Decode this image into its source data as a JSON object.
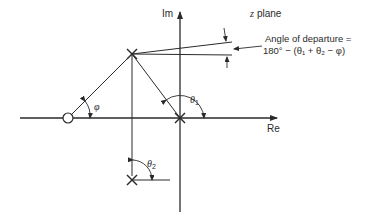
{
  "diagram": {
    "axes": {
      "imaginary_label": "Im",
      "real_label": "Re"
    },
    "poles": [
      {
        "name": "pole-upper",
        "x": 132,
        "y": 54
      },
      {
        "name": "pole-origin",
        "x": 180,
        "y": 118
      },
      {
        "name": "pole-lower",
        "x": 132,
        "y": 180
      }
    ],
    "zeros": [
      {
        "name": "zero",
        "x": 68,
        "y": 118
      }
    ],
    "angles": {
      "phi": "φ",
      "theta1": "θ",
      "theta1_sub": "1",
      "theta2": "θ",
      "theta2_sub": "2"
    },
    "annotation": {
      "line1": "Angle of departure =",
      "line2": "180° − (θ₁ + θ₂ − φ)"
    },
    "colors": {
      "stroke": "#2a2a2a",
      "background": "#ffffff"
    }
  }
}
